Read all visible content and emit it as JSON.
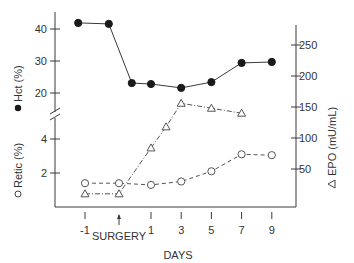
{
  "chart_data": {
    "type": "line",
    "title": "",
    "xlabel": "DAYS",
    "x_annotation": {
      "label": "SURGERY",
      "day": 0,
      "marker": "up-arrow"
    },
    "x_ticks": [
      "-1",
      "1",
      "3",
      "5",
      "7",
      "9"
    ],
    "x_tick_values": [
      -1,
      1,
      3,
      5,
      7,
      9
    ],
    "left_axis_upper": {
      "label": "Hct (%)",
      "marker": "filled-circle",
      "ticks": [
        "20",
        "30",
        "40"
      ],
      "tick_values": [
        20,
        30,
        40
      ],
      "range": [
        18,
        44
      ]
    },
    "left_axis_lower": {
      "label": "Retic (%)",
      "marker": "open-circle",
      "ticks": [
        "2",
        "4"
      ],
      "tick_values": [
        2,
        4
      ],
      "range": [
        0,
        5
      ]
    },
    "axis_break": true,
    "right_axis": {
      "label": "EPO (mU/mL)",
      "marker": "open-triangle",
      "ticks": [
        "50",
        "100",
        "150",
        "200",
        "250"
      ],
      "tick_values": [
        50,
        100,
        150,
        200,
        250
      ],
      "range": [
        0,
        280
      ]
    },
    "series": [
      {
        "name": "Hct (%)",
        "axis": "left_upper",
        "style": "solid",
        "points": [
          {
            "x": -1.2,
            "y": 41.9
          },
          {
            "x": -0.3,
            "y": 41.6
          },
          {
            "x": 0.4,
            "y": 23.1
          },
          {
            "x": 1,
            "y": 22.8
          },
          {
            "x": 3,
            "y": 21.6
          },
          {
            "x": 5,
            "y": 23.4
          },
          {
            "x": 7,
            "y": 29.4
          },
          {
            "x": 9,
            "y": 29.7
          }
        ]
      },
      {
        "name": "Retic (%)",
        "axis": "left_lower",
        "style": "dashed",
        "points": [
          {
            "x": -1,
            "y": 1.4
          },
          {
            "x": 0,
            "y": 1.4
          },
          {
            "x": 1,
            "y": 1.3
          },
          {
            "x": 3,
            "y": 1.5
          },
          {
            "x": 5,
            "y": 2.1
          },
          {
            "x": 7,
            "y": 3.1
          },
          {
            "x": 9,
            "y": 3.05
          }
        ]
      },
      {
        "name": "EPO (mU/mL)",
        "axis": "right",
        "style": "dash-dot",
        "points": [
          {
            "x": -1,
            "y": 10
          },
          {
            "x": 0,
            "y": 10
          },
          {
            "x": 1,
            "y": 84
          },
          {
            "x": 2,
            "y": 118
          },
          {
            "x": 3,
            "y": 156
          },
          {
            "x": 5,
            "y": 148
          },
          {
            "x": 7,
            "y": 140
          }
        ]
      }
    ]
  }
}
